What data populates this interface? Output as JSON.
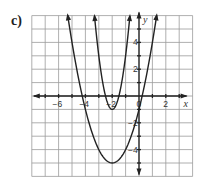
{
  "figure": {
    "part_label": "c)"
  },
  "chart_data": {
    "type": "line",
    "title": "",
    "xlabel": "x",
    "ylabel": "y",
    "xlim": [
      -8,
      4
    ],
    "ylim": [
      -6,
      6
    ],
    "grid": true,
    "x_tick_labels": [
      "-6",
      "-4",
      "-2",
      "0",
      "2"
    ],
    "y_tick_labels": [
      "4",
      "2",
      "-2",
      "-4"
    ],
    "series": [
      {
        "name": "narrow parabola",
        "equation": "y = 4(x + 2)^2 - 1",
        "vertex": [
          -2,
          -1
        ],
        "x_intercepts": [
          -2.5,
          -1.5
        ],
        "y_intercept": 15,
        "x_range_shown": [
          -3.32,
          -0.68
        ]
      },
      {
        "name": "wide parabola",
        "equation": "y = (x + 2)^2 - 5",
        "vertex": [
          -2,
          -5
        ],
        "x_intercepts": [
          -4.24,
          0.24
        ],
        "y_intercept": -1,
        "x_range_shown": [
          -5.32,
          1.32
        ]
      }
    ],
    "legend": null
  }
}
